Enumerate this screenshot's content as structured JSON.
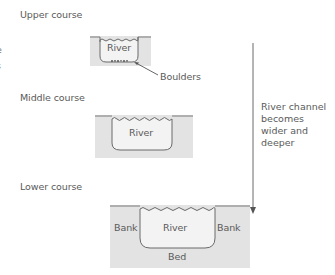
{
  "stages": [
    {
      "id": "upper",
      "title": "Upper course",
      "river_label": "River",
      "callout": "Boulders"
    },
    {
      "id": "middle",
      "title": "Middle course",
      "river_label": "River"
    },
    {
      "id": "lower",
      "title": "Lower course",
      "river_label": "River",
      "bank_left": "Bank",
      "bank_right": "Bank",
      "bed": "Bed"
    }
  ],
  "trend_arrow": {
    "text": "River channel becomes wider and deeper"
  },
  "left_fragments": [
    "e",
    "s"
  ],
  "colors": {
    "ground": "#e3e3e3",
    "ground_edge": "#c8c8c8",
    "water": "#f3f3f3",
    "outline": "#6a6a6a",
    "text": "#5a5a5a",
    "arrow": "#6a6a6a"
  }
}
